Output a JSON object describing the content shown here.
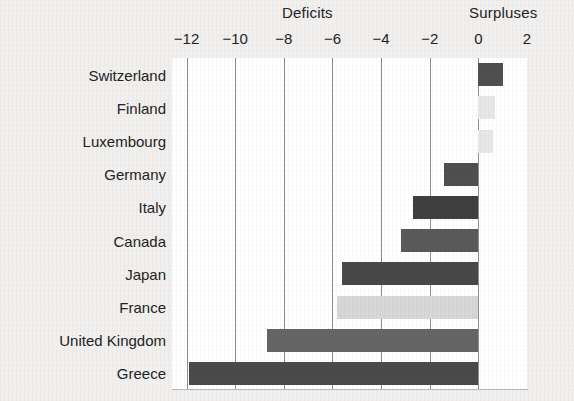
{
  "header": {
    "deficits_label": "Deficits",
    "surpluses_label": "Surpluses"
  },
  "colors": {
    "bar_dark": "#4f4f4f",
    "bar_mid": "#d7d7d7",
    "bar_light": "#e7e7e7",
    "gridline": "#8d8d8d",
    "plot_background": "#ffffff",
    "page_background": "#f1f0ee",
    "text": "#232323"
  },
  "chart_data": {
    "type": "bar",
    "orientation": "horizontal",
    "title": "",
    "subtitle": "",
    "xlabel": "",
    "ylabel": "",
    "xlim": [
      -12.6,
      2.0
    ],
    "xticks": [
      -12,
      -10,
      -8,
      -6,
      -4,
      -2,
      0,
      2
    ],
    "xticklabels": [
      "−12",
      "−10",
      "−8",
      "−6",
      "−4",
      "−2",
      "0",
      "2"
    ],
    "grid": true,
    "grid_axis": "x",
    "legend": false,
    "annotations": [
      "Deficits",
      "Surpluses"
    ],
    "categories": [
      "Switzerland",
      "Finland",
      "Luxembourg",
      "Germany",
      "Italy",
      "Canada",
      "Japan",
      "France",
      "United Kingdom",
      "Greece"
    ],
    "values": [
      1.0,
      0.7,
      0.6,
      -1.4,
      -2.7,
      -3.2,
      -5.6,
      -5.8,
      -8.7,
      -11.9
    ],
    "bar_colors": [
      "#4f4f4f",
      "#e7e7e7",
      "#e7e7e7",
      "#4f4f4f",
      "#3f3f3f",
      "#5a5a5a",
      "#484848",
      "#d7d7d7",
      "#656565",
      "#4a4a4a"
    ],
    "bars": [
      {
        "category": "Switzerland",
        "value": 1.0,
        "color": "#4f4f4f"
      },
      {
        "category": "Finland",
        "value": 0.7,
        "color": "#e7e7e7"
      },
      {
        "category": "Luxembourg",
        "value": 0.6,
        "color": "#e7e7e7"
      },
      {
        "category": "Germany",
        "value": -1.4,
        "color": "#4f4f4f"
      },
      {
        "category": "Italy",
        "value": -2.7,
        "color": "#3f3f3f"
      },
      {
        "category": "Canada",
        "value": -3.2,
        "color": "#5a5a5a"
      },
      {
        "category": "Japan",
        "value": -5.6,
        "color": "#484848"
      },
      {
        "category": "France",
        "value": -5.8,
        "color": "#d7d7d7"
      },
      {
        "category": "United Kingdom",
        "value": -8.7,
        "color": "#656565"
      },
      {
        "category": "Greece",
        "value": -11.9,
        "color": "#4a4a4a"
      }
    ]
  }
}
